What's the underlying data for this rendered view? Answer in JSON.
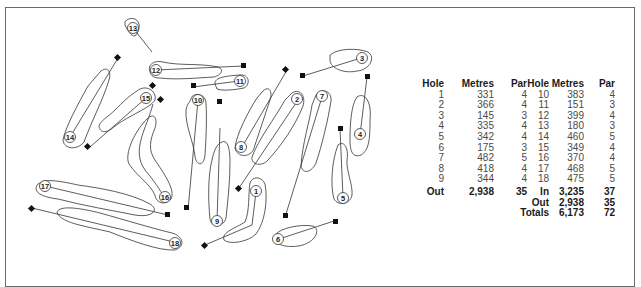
{
  "diagram": {
    "type": "golf course layout",
    "holes": [
      {
        "number": "1",
        "label": "1"
      },
      {
        "number": "2",
        "label": "2"
      },
      {
        "number": "3",
        "label": "3"
      },
      {
        "number": "4",
        "label": "4"
      },
      {
        "number": "5",
        "label": "5"
      },
      {
        "number": "6",
        "label": "6"
      },
      {
        "number": "7",
        "label": "7"
      },
      {
        "number": "8",
        "label": "8"
      },
      {
        "number": "9",
        "label": "9"
      },
      {
        "number": "10",
        "label": "10"
      },
      {
        "number": "11",
        "label": "11"
      },
      {
        "number": "12",
        "label": "12"
      },
      {
        "number": "13",
        "label": "13"
      },
      {
        "number": "14",
        "label": "14"
      },
      {
        "number": "15",
        "label": "15"
      },
      {
        "number": "16",
        "label": "16"
      },
      {
        "number": "17",
        "label": "17"
      },
      {
        "number": "18",
        "label": "18"
      }
    ],
    "colors": {
      "outline": "#333333",
      "tee_marker": "#111111",
      "frame": "#6a6a6a",
      "text": "#4a4a4a",
      "bold_text": "#1a1a1a"
    }
  },
  "scorecard": {
    "headers": {
      "hole": "Hole",
      "metres": "Metres",
      "par": "Par"
    },
    "front_nine": [
      {
        "hole": "1",
        "metres": "331",
        "par": "4"
      },
      {
        "hole": "2",
        "metres": "366",
        "par": "4"
      },
      {
        "hole": "3",
        "metres": "145",
        "par": "3"
      },
      {
        "hole": "4",
        "metres": "335",
        "par": "4"
      },
      {
        "hole": "5",
        "metres": "342",
        "par": "4"
      },
      {
        "hole": "6",
        "metres": "175",
        "par": "3"
      },
      {
        "hole": "7",
        "metres": "482",
        "par": "5"
      },
      {
        "hole": "8",
        "metres": "418",
        "par": "4"
      },
      {
        "hole": "9",
        "metres": "344",
        "par": "4"
      }
    ],
    "front_total": {
      "label": "Out",
      "metres": "2,938",
      "par": "35"
    },
    "back_nine": [
      {
        "hole": "10",
        "metres": "383",
        "par": "4"
      },
      {
        "hole": "11",
        "metres": "151",
        "par": "3"
      },
      {
        "hole": "12",
        "metres": "399",
        "par": "4"
      },
      {
        "hole": "13",
        "metres": "180",
        "par": "3"
      },
      {
        "hole": "14",
        "metres": "460",
        "par": "5"
      },
      {
        "hole": "15",
        "metres": "349",
        "par": "4"
      },
      {
        "hole": "16",
        "metres": "370",
        "par": "4"
      },
      {
        "hole": "17",
        "metres": "468",
        "par": "5"
      },
      {
        "hole": "18",
        "metres": "475",
        "par": "5"
      }
    ],
    "back_totals": [
      {
        "label": "In",
        "metres": "3,235",
        "par": "37"
      },
      {
        "label": "Out",
        "metres": "2,938",
        "par": "35"
      },
      {
        "label": "Totals",
        "metres": "6,173",
        "par": "72"
      }
    ]
  }
}
